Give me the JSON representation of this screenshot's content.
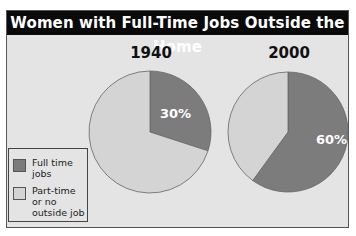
{
  "chart_data": {
    "type": "pie",
    "title": "Women with Full-Time Jobs Outside the Home",
    "legend": {
      "position": "bottom-left",
      "entries": [
        {
          "label": "Full time jobs",
          "display": "Full time\njobs",
          "color": "#7c7c7c"
        },
        {
          "label": "Part-time or no outside job",
          "display": "Part-time\nor no\noutside job",
          "color": "#d4d4d4"
        }
      ]
    },
    "pies": [
      {
        "year": "1940",
        "categories": [
          "Full time jobs",
          "Part-time or no outside job"
        ],
        "values": [
          30,
          70
        ],
        "label": "30%"
      },
      {
        "year": "2000",
        "categories": [
          "Full time jobs",
          "Part-time or no outside job"
        ],
        "values": [
          60,
          40
        ],
        "label": "60%"
      }
    ]
  },
  "colors": {
    "header_bg": "#0a0a0a",
    "panel_bg": "#e4e4e4",
    "full_time": "#7c7c7c",
    "part_time": "#d4d4d4"
  }
}
